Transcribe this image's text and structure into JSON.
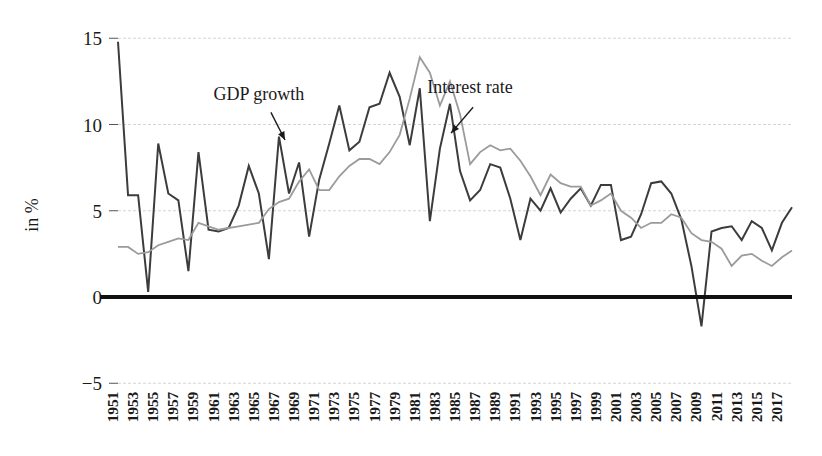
{
  "chart_data": {
    "type": "line",
    "title": "",
    "xlabel": "",
    "ylabel": "in %",
    "ylim": [
      -5,
      15
    ],
    "yticks": [
      -5,
      0,
      5,
      10,
      15
    ],
    "ytick_labels": [
      "−5",
      "0",
      "5",
      "10",
      "15"
    ],
    "grid": true,
    "legend_position": "inline-annotations",
    "x": [
      1951,
      1952,
      1953,
      1954,
      1955,
      1956,
      1957,
      1958,
      1959,
      1960,
      1961,
      1962,
      1963,
      1964,
      1965,
      1966,
      1967,
      1968,
      1969,
      1970,
      1971,
      1972,
      1973,
      1974,
      1975,
      1976,
      1977,
      1978,
      1979,
      1980,
      1981,
      1982,
      1983,
      1984,
      1985,
      1986,
      1987,
      1988,
      1989,
      1990,
      1991,
      1992,
      1993,
      1994,
      1995,
      1996,
      1997,
      1998,
      1999,
      2000,
      2001,
      2002,
      2003,
      2004,
      2005,
      2006,
      2007,
      2008,
      2009,
      2010,
      2011,
      2012,
      2013,
      2014,
      2015,
      2016,
      2017,
      2018
    ],
    "xtick_labels": [
      "1951",
      "1953",
      "1955",
      "1957",
      "1959",
      "1961",
      "1963",
      "1965",
      "1967",
      "1969",
      "1971",
      "1973",
      "1975",
      "1977",
      "1979",
      "1981",
      "1983",
      "1985",
      "1987",
      "1989",
      "1991",
      "1993",
      "1995",
      "1997",
      "1999",
      "2001",
      "2003",
      "2005",
      "2007",
      "2009",
      "2011",
      "2013",
      "2015",
      "2017"
    ],
    "xlim": [
      1951,
      2018
    ],
    "series": [
      {
        "name": "GDP growth",
        "color": "#3c3c3c",
        "linewidth": 2.0,
        "values": [
          14.8,
          5.9,
          5.9,
          0.3,
          8.9,
          6.0,
          5.6,
          1.5,
          8.4,
          3.9,
          3.8,
          4.0,
          5.3,
          7.6,
          6.0,
          2.2,
          9.3,
          6.0,
          7.8,
          3.5,
          6.8,
          8.9,
          11.1,
          8.5,
          9.0,
          11.0,
          11.2,
          13.0,
          11.6,
          8.8,
          12.1,
          4.4,
          8.6,
          11.2,
          7.3,
          5.6,
          6.2,
          7.7,
          7.5,
          5.7,
          3.3,
          5.7,
          5.0,
          6.3,
          4.9,
          5.7,
          6.3,
          5.3,
          6.5,
          6.5,
          3.3,
          3.5,
          4.8,
          6.6,
          6.7,
          6.0,
          4.5,
          1.8,
          -1.7,
          3.8,
          4.0,
          4.1,
          3.3,
          4.4,
          4.0,
          2.7,
          4.3,
          5.2
        ]
      },
      {
        "name": "Interest rate",
        "color": "#9b9b9b",
        "linewidth": 1.8,
        "values": [
          2.9,
          2.9,
          2.5,
          2.6,
          3.0,
          3.2,
          3.4,
          3.3,
          4.3,
          4.1,
          3.9,
          4.0,
          4.1,
          4.2,
          4.3,
          5.1,
          5.5,
          5.7,
          6.7,
          7.4,
          6.2,
          6.2,
          7.0,
          7.6,
          8.0,
          8.0,
          7.7,
          8.4,
          9.4,
          11.5,
          13.9,
          13.0,
          11.1,
          12.5,
          10.6,
          7.7,
          8.4,
          8.8,
          8.5,
          8.6,
          7.9,
          7.0,
          5.9,
          7.1,
          6.6,
          6.4,
          6.4,
          5.3,
          5.6,
          6.0,
          5.0,
          4.6,
          4.0,
          4.3,
          4.3,
          4.8,
          4.6,
          3.7,
          3.3,
          3.2,
          2.8,
          1.8,
          2.4,
          2.5,
          2.1,
          1.8,
          2.3,
          2.7
        ]
      }
    ],
    "annotations": [
      {
        "text": "GDP growth",
        "text_x": 1965,
        "text_y": 11.4,
        "arrow_from_x": 1966.2,
        "arrow_from_y": 10.7,
        "arrow_to_x": 1967.6,
        "arrow_to_y": 9.1
      },
      {
        "text": "Interest rate",
        "text_x": 1986,
        "text_y": 11.8,
        "arrow_from_x": 1986.3,
        "arrow_from_y": 11.0,
        "arrow_to_x": 1984.1,
        "arrow_to_y": 9.5
      }
    ]
  },
  "colors": {
    "gdp_growth": "#3c3c3c",
    "interest_rate": "#9b9b9b",
    "gridline": "#cfcfcf",
    "zero_axis": "#111111",
    "text": "#1a1a1a",
    "background": "#ffffff"
  }
}
